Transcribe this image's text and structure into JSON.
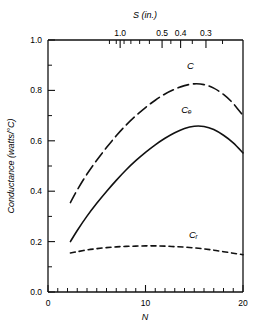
{
  "figure": {
    "background_color": "#ffffff",
    "ink_color": "#111111"
  },
  "chart_data": {
    "type": "line",
    "title": "",
    "xlabel": "N",
    "ylabel": "Conductance (watts/°C)",
    "top_axis_label": "S (in.)",
    "xlim": [
      0,
      20
    ],
    "ylim": [
      0.0,
      1.0
    ],
    "grid": false,
    "legend_position": "inline-labels",
    "x_ticks_major": [
      0,
      10,
      20
    ],
    "x_tick_labels": [
      "0",
      "10",
      "20"
    ],
    "x_ticks_minor_step": 1,
    "y_ticks_major": [
      0.0,
      0.2,
      0.4,
      0.6,
      0.8,
      1.0
    ],
    "y_tick_labels": [
      "0.0",
      "0.2",
      "0.4",
      "0.6",
      "0.8",
      "1.0"
    ],
    "y_ticks_minor": [
      0.1,
      0.3,
      0.5,
      0.7,
      0.9
    ],
    "top_axis": {
      "label": "S (in.)",
      "labeled_ticks": [
        {
          "value": "1.0",
          "n": 7.4
        },
        {
          "value": "0.5",
          "n": 11.7
        },
        {
          "value": "0.4",
          "n": 13.6
        },
        {
          "value": "0.3",
          "n": 16.2
        }
      ],
      "minor_ticks_n": [
        6.3,
        7.0,
        7.8,
        8.5,
        9.4,
        10.4,
        12.6,
        14.8,
        17.9
      ]
    },
    "series": [
      {
        "name": "C",
        "label": "C",
        "style": "long-dash",
        "label_position": {
          "n": 14.6,
          "y": 0.885
        },
        "x": [
          2.3,
          3,
          4,
          5,
          6,
          7,
          8,
          9,
          10,
          11,
          12,
          13,
          14,
          15,
          16,
          17,
          18,
          19,
          20
        ],
        "values": [
          0.355,
          0.405,
          0.468,
          0.523,
          0.573,
          0.62,
          0.662,
          0.699,
          0.732,
          0.761,
          0.786,
          0.805,
          0.819,
          0.826,
          0.823,
          0.809,
          0.784,
          0.748,
          0.7
        ]
      },
      {
        "name": "Cc",
        "label": "Cₑ",
        "style": "solid",
        "label_position": {
          "n": 14.2,
          "y": 0.712
        },
        "x": [
          2.3,
          3,
          4,
          5,
          6,
          7,
          8,
          9,
          10,
          11,
          12,
          13,
          14,
          15,
          16,
          17,
          18,
          19,
          20
        ],
        "values": [
          0.2,
          0.244,
          0.301,
          0.352,
          0.399,
          0.443,
          0.484,
          0.521,
          0.554,
          0.584,
          0.61,
          0.632,
          0.649,
          0.658,
          0.657,
          0.645,
          0.622,
          0.592,
          0.552
        ]
      },
      {
        "name": "Cr",
        "label": "Cᵣ",
        "style": "short-dash",
        "label_position": {
          "n": 14.9,
          "y": 0.215
        },
        "x": [
          2.3,
          3,
          4,
          5,
          6,
          7,
          8,
          9,
          10,
          11,
          12,
          13,
          14,
          15,
          16,
          17,
          18,
          19,
          20
        ],
        "values": [
          0.155,
          0.16,
          0.167,
          0.172,
          0.176,
          0.179,
          0.181,
          0.182,
          0.183,
          0.183,
          0.182,
          0.18,
          0.178,
          0.175,
          0.171,
          0.166,
          0.16,
          0.154,
          0.148
        ]
      }
    ]
  }
}
